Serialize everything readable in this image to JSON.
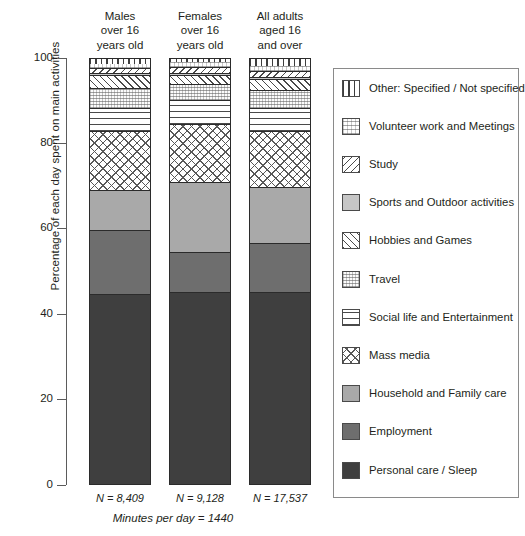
{
  "axis": {
    "y_title": "Percentage of each day spent on main activities",
    "ticks": [
      "100",
      "80",
      "60",
      "40",
      "20",
      "0"
    ]
  },
  "columns": [
    {
      "header": "Males\nover 16\nyears old",
      "n_label": "N = 8,409"
    },
    {
      "header": "Females\nover 16\nyears old",
      "n_label": "N = 9,128"
    },
    {
      "header": "All adults\naged 16\nand over",
      "n_label": "N = 17,537"
    }
  ],
  "footnote": "Minutes per day = 1440",
  "legend": {
    "items": [
      {
        "label": "Other: Specified / Not specified",
        "pattern": "vertical-stripes",
        "icon": "swatch-other-icon"
      },
      {
        "label": "Volunteer work and Meetings",
        "pattern": "fine-dots",
        "icon": "swatch-volunteer-icon"
      },
      {
        "label": "Study",
        "pattern": "backslash-hatch",
        "icon": "swatch-study-icon"
      },
      {
        "label": "Sports and Outdoor activities",
        "pattern": "light-grey-solid",
        "icon": "swatch-sports-icon"
      },
      {
        "label": "Hobbies and Games",
        "pattern": "forward-hatch",
        "icon": "swatch-hobbies-icon"
      },
      {
        "label": "Travel",
        "pattern": "stipple-dots",
        "icon": "swatch-travel-icon"
      },
      {
        "label": "Social life and Entertainment",
        "pattern": "horizontal-stripes",
        "icon": "swatch-social-icon"
      },
      {
        "label": "Mass media",
        "pattern": "cross-hatch",
        "icon": "swatch-massmedia-icon"
      },
      {
        "label": "Household and Family care",
        "pattern": "mid-grey-solid",
        "icon": "swatch-household-icon"
      },
      {
        "label": "Employment",
        "pattern": "dark-grey-solid",
        "icon": "swatch-employment-icon"
      },
      {
        "label": "Personal care / Sleep",
        "pattern": "near-black-solid",
        "icon": "swatch-personal-icon"
      }
    ]
  },
  "chart_data": {
    "type": "bar",
    "stacked": true,
    "title": "",
    "xlabel": "",
    "ylabel": "Percentage of each day spent on main activities",
    "ylim": [
      0,
      100
    ],
    "yticks": [
      0,
      20,
      40,
      60,
      80,
      100
    ],
    "grid": false,
    "legend_position": "right",
    "categories": [
      "Males over 16 years old",
      "Females over 16 years old",
      "All adults aged 16 and over"
    ],
    "sample_sizes": [
      8409,
      9128,
      17537
    ],
    "minutes_per_day": 1440,
    "series": [
      {
        "name": "Personal care / Sleep",
        "values": [
          44.5,
          45.0,
          45.0
        ]
      },
      {
        "name": "Employment",
        "values": [
          15.0,
          9.4,
          11.5
        ]
      },
      {
        "name": "Household and Family care",
        "values": [
          9.4,
          16.4,
          13.1
        ]
      },
      {
        "name": "Mass media",
        "values": [
          14.0,
          13.6,
          13.1
        ]
      },
      {
        "name": "Social life and Entertainment",
        "values": [
          5.2,
          5.6,
          5.4
        ]
      },
      {
        "name": "Travel",
        "values": [
          4.7,
          3.7,
          4.2
        ]
      },
      {
        "name": "Hobbies and Games",
        "values": [
          3.0,
          2.1,
          2.6
        ]
      },
      {
        "name": "Sports and Outdoor activities",
        "values": [
          0.5,
          0.5,
          0.5
        ]
      },
      {
        "name": "Study",
        "values": [
          1.2,
          1.4,
          1.4
        ]
      },
      {
        "name": "Volunteer work and Meetings",
        "values": [
          1.2,
          1.4,
          1.4
        ]
      },
      {
        "name": "Other: Specified / Not specified",
        "values": [
          1.3,
          0.9,
          1.8
        ]
      }
    ]
  }
}
